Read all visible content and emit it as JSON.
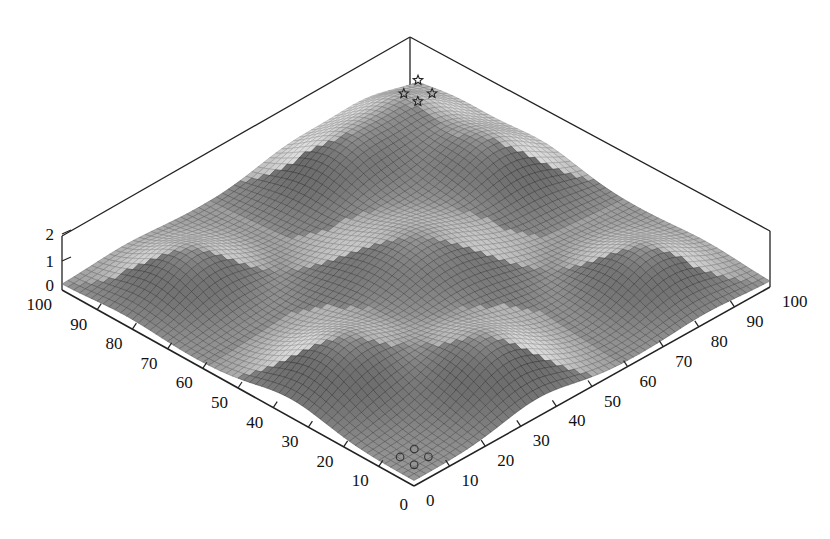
{
  "chart_data": {
    "type": "surface3d",
    "title": "",
    "xlabel": "",
    "ylabel": "",
    "zlabel": "",
    "x_range": [
      0,
      100
    ],
    "y_range": [
      0,
      100
    ],
    "z_range": [
      0,
      2
    ],
    "x_ticks": [
      "0",
      "10",
      "20",
      "30",
      "40",
      "50",
      "60",
      "70",
      "80",
      "90",
      "100"
    ],
    "y_ticks": [
      "0",
      "10",
      "20",
      "30",
      "40",
      "50",
      "60",
      "70",
      "80",
      "90",
      "100"
    ],
    "z_ticks": [
      "0",
      "1",
      "2"
    ],
    "surface": {
      "description": "Gaussian bumps on a flat base (z≈0.2); five peaks: center and four at edge midpoints-ish",
      "base": 0.2,
      "peaks": [
        {
          "x": 50,
          "y": 50,
          "height": 1.6,
          "sigma": 14
        },
        {
          "x": 85,
          "y": 65,
          "height": 1.5,
          "sigma": 10
        },
        {
          "x": 65,
          "y": 85,
          "height": 1.5,
          "sigma": 10
        },
        {
          "x": 15,
          "y": 35,
          "height": 1.5,
          "sigma": 10
        },
        {
          "x": 35,
          "y": 15,
          "height": 1.5,
          "sigma": 10
        },
        {
          "x": 85,
          "y": 88,
          "height": 1.3,
          "sigma": 9
        },
        {
          "x": 18,
          "y": 82,
          "height": 1.2,
          "sigma": 9
        },
        {
          "x": 82,
          "y": 18,
          "height": 1.2,
          "sigma": 9
        }
      ]
    },
    "markers": [
      {
        "shape": "star",
        "x": 100,
        "y": 100,
        "z": 0.4
      },
      {
        "shape": "star",
        "x": 96,
        "y": 100,
        "z": 0.2
      },
      {
        "shape": "star",
        "x": 100,
        "y": 96,
        "z": 0.2
      },
      {
        "shape": "star",
        "x": 96,
        "y": 96,
        "z": 0.2
      },
      {
        "shape": "circle",
        "x": 8,
        "y": 8,
        "z": 0.2
      },
      {
        "shape": "circle",
        "x": 4,
        "y": 8,
        "z": 0.2
      },
      {
        "shape": "circle",
        "x": 8,
        "y": 4,
        "z": 0.2
      },
      {
        "shape": "circle",
        "x": 4,
        "y": 4,
        "z": 0.2
      }
    ],
    "legend": null,
    "grid": false,
    "colormap": "grayscale wireframe"
  },
  "colors": {
    "axis": "#222222",
    "mesh": "#555555",
    "background": "#ffffff"
  }
}
